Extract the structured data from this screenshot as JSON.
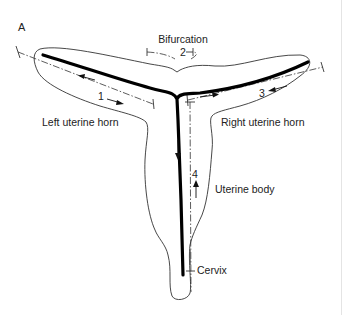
{
  "figure": {
    "panel_label": "A",
    "labels": {
      "bifurcation": "Bifurcation",
      "left_horn": "Left uterine horn",
      "right_horn": "Right uterine horn",
      "uterine_body": "Uterine body",
      "cervix": "Cervix"
    },
    "segments": {
      "left_horn": "1",
      "bifurcation": "2",
      "right_horn": "3",
      "uterine_body": "4"
    },
    "colors": {
      "lumen": "#000000",
      "outline": "#333333",
      "background": "#ffffff"
    }
  }
}
